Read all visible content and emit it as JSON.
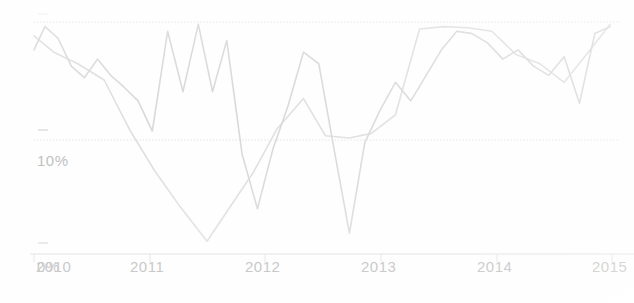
{
  "chart_data": {
    "type": "line",
    "title": "",
    "subtitle": "",
    "xlabel": "",
    "ylabel": "",
    "xlim": [
      2010,
      2015.35
    ],
    "ylim": [
      -4,
      22
    ],
    "grid": true,
    "grid_style": "dotted-horizontal",
    "legend": "none",
    "appearance": "faded scanned line chart, very light gray strokes, no markers",
    "x_ticks": [
      "2010",
      "2011",
      "2012",
      "2013",
      "2014",
      "2015"
    ],
    "x_tick_values": [
      2010,
      2011,
      2012,
      2013,
      2014,
      2015
    ],
    "y_ticks": [
      "",
      "10%",
      "0%"
    ],
    "y_tick_values": [
      20,
      10,
      0
    ],
    "y_tick_labels_visible": [
      "10%",
      "0%"
    ],
    "note_overlap": "the 0% y-tick label overlaps the 2010 x-tick label at the origin",
    "series": [
      {
        "name": "series-1",
        "color": "#d8d8d8",
        "x": [
          2010.0,
          2010.1,
          2010.22,
          2010.34,
          2010.46,
          2010.58,
          2010.7,
          2010.82,
          2010.95,
          2011.08,
          2011.22,
          2011.36,
          2011.5,
          2011.63,
          2011.76,
          2011.9,
          2012.04,
          2012.18,
          2012.32,
          2012.46,
          2012.6,
          2012.74,
          2012.88,
          2013.02,
          2013.16,
          2013.3,
          2013.44,
          2013.58,
          2013.72,
          2013.86,
          2014.0,
          2014.14,
          2014.28,
          2014.42,
          2014.56,
          2014.7,
          2014.84,
          2014.98,
          2015.12,
          2015.26
        ],
        "y": [
          17.6,
          19.6,
          18.6,
          16.2,
          15.2,
          16.8,
          15.4,
          14.4,
          13.2,
          10.6,
          19.2,
          14.0,
          19.8,
          14.0,
          18.4,
          8.6,
          3.9,
          9.0,
          12.8,
          17.4,
          16.4,
          9.0,
          1.8,
          9.6,
          12.4,
          14.8,
          13.2,
          15.4,
          17.6,
          19.2,
          19.0,
          18.2,
          16.8,
          17.6,
          16.2,
          15.4,
          17.0,
          13.0,
          19.0,
          19.6
        ]
      },
      {
        "name": "series-2",
        "color": "#dedede",
        "x": [
          2010.0,
          2010.18,
          2010.4,
          2010.64,
          2010.88,
          2011.1,
          2011.34,
          2011.58,
          2011.8,
          2012.0,
          2012.22,
          2012.46,
          2012.66,
          2012.88,
          2013.08,
          2013.3,
          2013.52,
          2013.74,
          2013.96,
          2014.18,
          2014.4,
          2014.62,
          2014.84,
          2015.06,
          2015.26
        ],
        "y": [
          18.8,
          17.4,
          16.4,
          15.0,
          10.6,
          7.2,
          4.0,
          1.1,
          4.2,
          7.0,
          10.8,
          13.4,
          10.2,
          10.0,
          10.4,
          12.0,
          19.4,
          19.6,
          19.5,
          19.2,
          17.2,
          16.4,
          14.8,
          17.4,
          19.8
        ]
      }
    ]
  },
  "axis": {
    "y_label_10": "10%",
    "y_label_0": "0%",
    "x_label_2010": "2010",
    "x_label_2011": "2011",
    "x_label_2012": "2012",
    "x_label_2013": "2013",
    "x_label_2014": "2014",
    "x_label_2015": "2015"
  },
  "colors": {
    "series_1": "#d8d8d8",
    "series_2": "#dedede",
    "grid": "#e4e4e4",
    "axis": "#dcdcdc",
    "text": "#b9b9b9",
    "background": "#ffffff"
  }
}
